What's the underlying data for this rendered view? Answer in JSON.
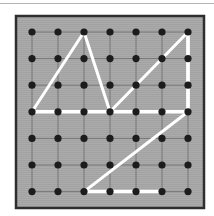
{
  "board": {
    "rows": 7,
    "cols": 7,
    "origin_px": [
      32,
      32
    ],
    "spacing_px": [
      26,
      26.6
    ],
    "frame": {
      "x": 16,
      "y": 16,
      "w": 188,
      "h": 192
    },
    "colors": {
      "background": "#a9a9a9",
      "grid": "#6a6a6a",
      "peg": "#1c1c1c",
      "band": "#ffffff",
      "frame": "#2e2e2e"
    }
  },
  "shapes": [
    {
      "name": "left-triangle",
      "points": [
        [
          0,
          3
        ],
        [
          2,
          0
        ],
        [
          3,
          3
        ]
      ]
    },
    {
      "name": "right-triangle",
      "points": [
        [
          3,
          3
        ],
        [
          6,
          0
        ],
        [
          6,
          3
        ]
      ]
    },
    {
      "name": "lower-triangle",
      "points": [
        [
          6,
          3
        ],
        [
          2,
          6
        ],
        [
          5,
          6
        ]
      ]
    }
  ],
  "segments": [
    {
      "name": "base-row-3",
      "from": [
        0,
        3
      ],
      "to": [
        6,
        3
      ]
    },
    {
      "name": "right-edge",
      "from": [
        6,
        0
      ],
      "to": [
        6,
        3
      ]
    },
    {
      "name": "bottom-edge",
      "from": [
        2,
        6
      ],
      "to": [
        5,
        6
      ]
    }
  ]
}
